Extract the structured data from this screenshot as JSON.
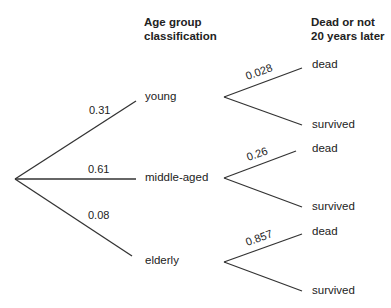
{
  "headers": {
    "age_line1": "Age group",
    "age_line2": "classification",
    "outcome_line1": "Dead or not",
    "outcome_line2": "20 years later"
  },
  "age_groups": [
    {
      "label": "young",
      "prob": "0.31",
      "dead_prob": "0.028",
      "dead_label": "dead",
      "survived_label": "survived"
    },
    {
      "label": "middle-aged",
      "prob": "0.61",
      "dead_prob": "0.26",
      "dead_label": "dead",
      "survived_label": "survived"
    },
    {
      "label": "elderly",
      "prob": "0.08",
      "dead_prob": "0.857",
      "dead_label": "dead",
      "survived_label": "survived"
    }
  ],
  "colors": {
    "line": "#333333",
    "text": "#222222"
  }
}
